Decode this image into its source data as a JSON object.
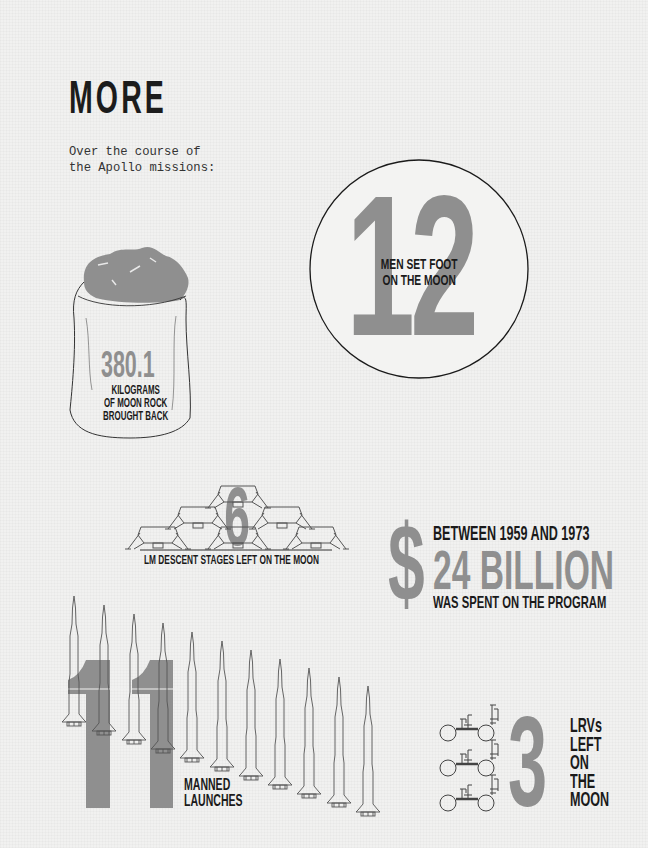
{
  "header": {
    "title": "MORE",
    "intro_line1": "Over the course of",
    "intro_line2": "the Apollo missions:"
  },
  "colors": {
    "background": "#f1f1f0",
    "accent_gray": "#8f8f8f",
    "text_dark": "#1a1a1a"
  },
  "stats": {
    "moon_rock": {
      "value": "380.1",
      "label_line1": "KILOGRAMS",
      "label_line2": "OF MOON ROCK",
      "label_line3": "BROUGHT BACK",
      "icon": "sack-of-rocks-icon"
    },
    "moonwalkers": {
      "value": "12",
      "label_line1": "MEN SET FOOT",
      "label_line2": "ON THE MOON",
      "icon": "person-icon",
      "figure_count": 12
    },
    "lm_stages": {
      "value": "6",
      "label": "LM DESCENT STAGES LEFT ON THE MOON",
      "icon": "lunar-module-icon",
      "count": 6
    },
    "cost": {
      "symbol": "$",
      "line1": "BETWEEN 1959 AND 1973",
      "value": "24 BILLION",
      "line3": "WAS SPENT ON THE PROGRAM"
    },
    "launches": {
      "value": "11",
      "label_line1": "MANNED",
      "label_line2": "LAUNCHES",
      "icon": "saturn-rocket-icon",
      "count": 11
    },
    "lrvs": {
      "value": "3",
      "label_line1": "LRVs",
      "label_line2": "LEFT",
      "label_line3": "ON",
      "label_line4": "THE",
      "label_line5": "MOON",
      "icon": "lunar-rover-icon",
      "count": 3
    }
  }
}
